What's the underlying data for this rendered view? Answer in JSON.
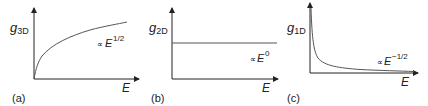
{
  "panels": [
    {
      "id": "a",
      "label": "(a)",
      "y_axis_symbol": "g",
      "y_axis_subscript": "3D",
      "x_axis_label": "E",
      "relation_prefix": "∝",
      "relation_base": "E",
      "relation_exponent": "1/2",
      "curve": "sqrt"
    },
    {
      "id": "b",
      "label": "(b)",
      "y_axis_symbol": "g",
      "y_axis_subscript": "2D",
      "x_axis_label": "E",
      "relation_prefix": "∝",
      "relation_base": "E",
      "relation_exponent": "0",
      "curve": "constant"
    },
    {
      "id": "c",
      "label": "(c)",
      "y_axis_symbol": "g",
      "y_axis_subscript": "1D",
      "x_axis_label": "E",
      "relation_prefix": "∝",
      "relation_base": "E",
      "relation_exponent": "−1/2",
      "curve": "inverse-sqrt"
    }
  ],
  "colors": {
    "axis": "#222222",
    "curve": "#555555"
  }
}
